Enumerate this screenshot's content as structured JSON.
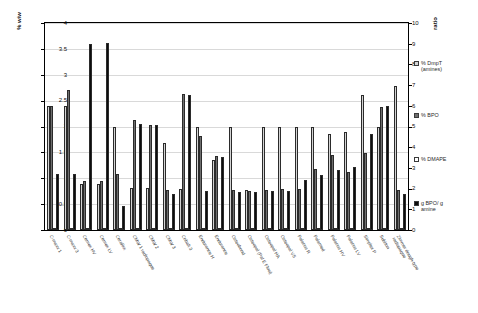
{
  "chart_data": {
    "type": "bar",
    "title": "",
    "xlabel": "",
    "ylabel": "% w/w",
    "y2label": "ratio",
    "ylim": [
      0,
      4
    ],
    "y2lim": [
      0,
      10
    ],
    "yticks": [
      "0",
      "0.5",
      "1",
      "1.5",
      "2",
      "2.5",
      "3",
      "3.5",
      "4"
    ],
    "y2ticks": [
      "0",
      "1",
      "2",
      "3",
      "4",
      "5",
      "6",
      "7",
      "8",
      "9",
      "10"
    ],
    "grid": true,
    "legend_position": "right",
    "categories": [
      "C-maxx 1",
      "C-maxx 3",
      "Cemex HV",
      "Cemex LV",
      "Cerafixx",
      "CMW 1 radiopaque",
      "CMW 2",
      "CMW 3",
      "Cobalt 3",
      "Endurance H",
      "Endurance",
      "Osteobond",
      "Osteopal (Pal E Flow)",
      "Osteopal HA",
      "Osteopal VS",
      "Palacos R",
      "Palamed",
      "Palacos HV",
      "Palacos LV",
      "Simplex P",
      "Subiton",
      "Zimmer dough-type radiopaque"
    ],
    "series": [
      {
        "name": "% DmpT (amines)",
        "color": "#d4d4d4",
        "axis": "left",
        "values": [
          2.4,
          2.4,
          0.88,
          0.88,
          2.0,
          0.82,
          0.82,
          1.68,
          0.8,
          2.0,
          1.35,
          2.0,
          0.78,
          2.0,
          2.0,
          2.0,
          2.0,
          1.86,
          1.9,
          2.6,
          2.0,
          2.78
        ]
      },
      {
        "name": "% BPO",
        "color": "#6e6e6e",
        "axis": "left",
        "values": [
          2.4,
          2.7,
          0.95,
          0.95,
          1.08,
          2.13,
          2.02,
          0.78,
          2.62,
          1.82,
          1.43,
          0.78,
          0.75,
          0.78,
          0.8,
          0.8,
          1.18,
          1.45,
          1.12,
          1.48,
          2.38,
          0.78
        ]
      },
      {
        "name": "% DMAPE",
        "color": "#ffffff",
        "axis": "left",
        "values": [
          0,
          0,
          0,
          0,
          0,
          0,
          0,
          0,
          0,
          0,
          0,
          0,
          0,
          0,
          0,
          0,
          0,
          0,
          0,
          0,
          0,
          0
        ]
      },
      {
        "name": "g BPO/ g amine",
        "color": "#0d0d0d",
        "axis": "right",
        "values": [
          2.7,
          2.73,
          8.98,
          9.05,
          1.15,
          5.1,
          5.08,
          1.75,
          6.53,
          1.9,
          3.52,
          1.82,
          1.85,
          1.88,
          1.9,
          2.42,
          2.65,
          2.92,
          3.05,
          4.62,
          5.98,
          1.72
        ]
      }
    ]
  },
  "axes": {
    "left": {
      "label": "% w/w",
      "ticks": [
        "0",
        "0.5",
        "1",
        "1.5",
        "2",
        "2.5",
        "3",
        "3.5",
        "4"
      ]
    },
    "right": {
      "label": "ratio",
      "ticks": [
        "0",
        "1",
        "2",
        "3",
        "4",
        "5",
        "6",
        "7",
        "8",
        "9",
        "10"
      ]
    }
  },
  "legend": {
    "items": [
      {
        "label": "% DmpT\n(amines)",
        "color": "#d4d4d4",
        "swatch": "open-square-icon"
      },
      {
        "label": "% BPO",
        "color": "#6e6e6e",
        "swatch": "filled-square-icon"
      },
      {
        "label": "% DMAPE",
        "color": "#ffffff",
        "swatch": "open-square-icon"
      },
      {
        "label": "g BPO/ g\namine",
        "color": "#0d0d0d",
        "swatch": "filled-square-icon"
      }
    ]
  }
}
